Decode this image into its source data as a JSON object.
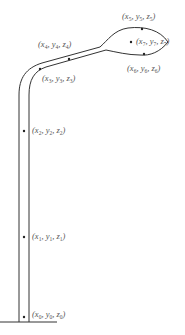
{
  "diagram": {
    "type": "lamp-post / pipe path with sample points",
    "stroke_color": "#333333",
    "label_color": "#555555",
    "points": [
      {
        "id": 0,
        "x": 24,
        "y": 317,
        "label": "(x0, y0, z0)",
        "lx": 32,
        "ly": 310
      },
      {
        "id": 1,
        "x": 24,
        "y": 237,
        "label": "(x1, y1, z1)",
        "lx": 32,
        "ly": 231
      },
      {
        "id": 2,
        "x": 24,
        "y": 131,
        "label": "(x2, y2, z2)",
        "lx": 32,
        "ly": 125
      },
      {
        "id": 3,
        "x": 40,
        "y": 70,
        "label": "(x3, y3, z3)",
        "lx": 42,
        "ly": 76
      },
      {
        "id": 4,
        "x": 69,
        "y": 60,
        "label": "(x4, y4, z4)",
        "lx": 39,
        "ly": 42
      },
      {
        "id": 5,
        "x": 142,
        "y": 29,
        "label": "(x5, y5, z5)",
        "lx": 123,
        "ly": 13
      },
      {
        "id": 6,
        "x": 144,
        "y": 54,
        "label": "(x6, y6, z6)",
        "lx": 127,
        "ly": 65
      },
      {
        "id": 7,
        "x": 131,
        "y": 42,
        "label": "(x7, y7, z7)",
        "lx": 137,
        "ly": 36
      }
    ],
    "labels": [
      {
        "sub": [
          "0",
          "0",
          "0"
        ]
      },
      {
        "sub": [
          "1",
          "1",
          "1"
        ]
      },
      {
        "sub": [
          "2",
          "2",
          "2"
        ]
      },
      {
        "sub": [
          "3",
          "3",
          "3"
        ]
      },
      {
        "sub": [
          "4",
          "4",
          "4"
        ]
      },
      {
        "sub": [
          "5",
          "5",
          "5"
        ]
      },
      {
        "sub": [
          "6",
          "6",
          "6"
        ]
      },
      {
        "sub": [
          "7",
          "7",
          "7"
        ]
      }
    ]
  }
}
